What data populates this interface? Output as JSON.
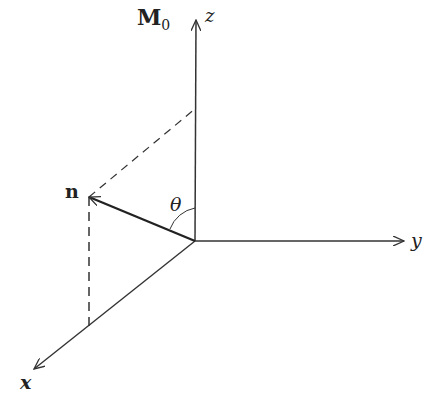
{
  "labels": {
    "magnetization": "M",
    "magnetization_sub": "0",
    "z_axis": "z",
    "y_axis": "y",
    "x_axis": "x",
    "vector_n": "n",
    "angle": "θ"
  },
  "colors": {
    "line": "#333333",
    "background": "#ffffff"
  }
}
